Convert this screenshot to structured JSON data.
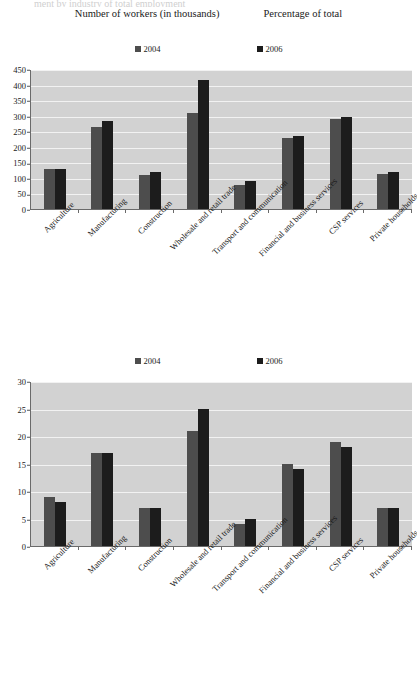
{
  "header": {
    "cut_text": "ment by industry                              of total employment",
    "title_left": "Number of workers (in thousands)",
    "title_right": "Percentage of total"
  },
  "legend": {
    "series": [
      {
        "label": "2004",
        "color": "#4d4d4d"
      },
      {
        "label": "2006",
        "color": "#1c1c1c"
      }
    ]
  },
  "chart_data": [
    {
      "type": "bar",
      "title": "Number of workers (in thousands)",
      "xlabel": "",
      "ylabel": "",
      "ylim": [
        0,
        450
      ],
      "yticks": [
        0,
        50,
        100,
        150,
        200,
        250,
        300,
        350,
        400,
        450
      ],
      "grid": true,
      "legend_position": "top",
      "categories": [
        "Agriculture",
        "Manufacturing",
        "Construction",
        "Wholesale and retail trade",
        "Transport and communication",
        "Financial and business services",
        "CSP services",
        "Private households"
      ],
      "series": [
        {
          "name": "2004",
          "color": "#4d4d4d",
          "values": [
            130,
            265,
            110,
            310,
            78,
            228,
            290,
            113
          ]
        },
        {
          "name": "2006",
          "color": "#1c1c1c",
          "values": [
            128,
            283,
            120,
            415,
            90,
            236,
            295,
            118
          ]
        }
      ]
    },
    {
      "type": "bar",
      "title": "Percentage of total",
      "xlabel": "",
      "ylabel": "",
      "ylim": [
        0,
        30
      ],
      "yticks": [
        0,
        5,
        10,
        15,
        20,
        25,
        30
      ],
      "grid": true,
      "legend_position": "top",
      "categories": [
        "Agriculture",
        "Manufacturing",
        "Construction",
        "Wholesale and retail trade",
        "Transport and communication",
        "Financial and business services",
        "CSP services",
        "Private households"
      ],
      "series": [
        {
          "name": "2004",
          "color": "#4d4d4d",
          "values": [
            9,
            17,
            7,
            21,
            4,
            15,
            19,
            7
          ]
        },
        {
          "name": "2006",
          "color": "#1c1c1c",
          "values": [
            8,
            17,
            7,
            25,
            5,
            14,
            18,
            7
          ]
        }
      ]
    }
  ]
}
